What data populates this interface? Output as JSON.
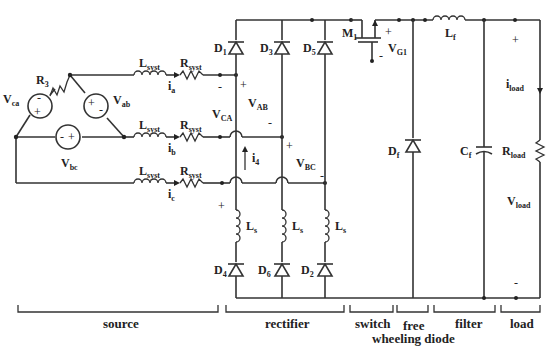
{
  "diagram": {
    "type": "buck converter with three-phase diode rectifier",
    "source": {
      "sources": [
        {
          "name": "V",
          "sub": "ab",
          "polarity": [
            "+",
            "-"
          ]
        },
        {
          "name": "V",
          "sub": "bc",
          "polarity": [
            "-",
            "+"
          ]
        },
        {
          "name": "V",
          "sub": "ca",
          "polarity": [
            "-",
            "+"
          ]
        }
      ],
      "resistor": {
        "name": "R",
        "sub": "3"
      },
      "line_inductor": {
        "name": "L",
        "sub": "syst"
      },
      "line_resistor": {
        "name": "R",
        "sub": "syst"
      },
      "currents": [
        {
          "name": "i",
          "sub": "a"
        },
        {
          "name": "i",
          "sub": "b"
        },
        {
          "name": "i",
          "sub": "c"
        }
      ]
    },
    "rectifier": {
      "diodes_top": [
        {
          "name": "D",
          "sub": "1"
        },
        {
          "name": "D",
          "sub": "3"
        },
        {
          "name": "D",
          "sub": "5"
        }
      ],
      "diodes_bottom": [
        {
          "name": "D",
          "sub": "4"
        },
        {
          "name": "D",
          "sub": "6"
        },
        {
          "name": "D",
          "sub": "2"
        }
      ],
      "inductor": {
        "name": "L",
        "sub": "s"
      },
      "voltages": [
        {
          "name": "V",
          "sub": "CA"
        },
        {
          "name": "V",
          "sub": "AB"
        },
        {
          "name": "V",
          "sub": "BC"
        }
      ],
      "current": {
        "name": "i",
        "sub": "4"
      }
    },
    "switch": {
      "mosfet": {
        "name": "M",
        "sub": "1"
      },
      "gate_voltage": {
        "name": "V",
        "sub": "G1"
      }
    },
    "freewheeling": {
      "diode": {
        "name": "D",
        "sub": "f"
      }
    },
    "filter": {
      "inductor": {
        "name": "L",
        "sub": "f"
      },
      "capacitor": {
        "name": "C",
        "sub": "f"
      }
    },
    "load": {
      "resistor": {
        "name": "R",
        "sub": "load"
      },
      "current": {
        "name": "i",
        "sub": "load"
      },
      "voltage": {
        "name": "V",
        "sub": "load"
      }
    },
    "sections": {
      "source": "source",
      "rectifier": "rectifier",
      "switch": "switch",
      "freewheel_line1": "free",
      "freewheel_line2": "wheeling diode",
      "filter": "filter",
      "load": "load"
    },
    "signs": {
      "plus": "+",
      "minus": "-"
    }
  }
}
